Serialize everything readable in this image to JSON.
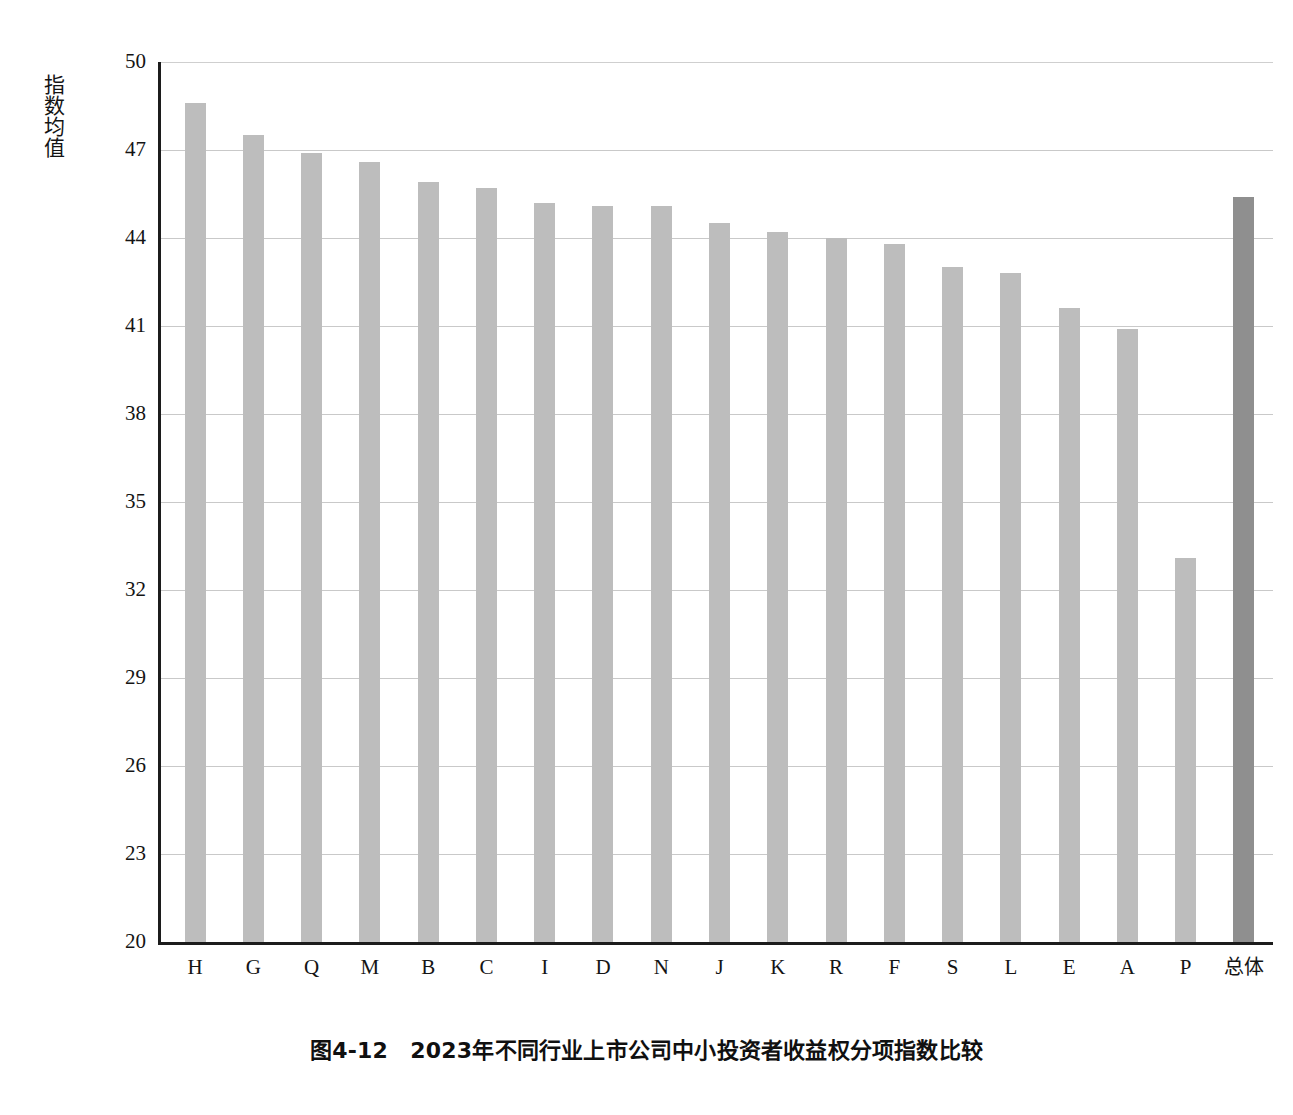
{
  "figure": {
    "caption": "图4-12　2023年不同行业上市公司中小投资者收益权分项指数比较",
    "y_axis_title": "指数均值"
  },
  "chart_data": {
    "type": "bar",
    "title": "图4-12　2023年不同行业上市公司中小投资者收益权分项指数比较",
    "xlabel": "",
    "ylabel": "指数均值",
    "ylim": [
      20,
      50
    ],
    "yticks": [
      20,
      23,
      26,
      29,
      32,
      35,
      38,
      41,
      44,
      47,
      50
    ],
    "ytick_labels": [
      "20",
      "23",
      "26",
      "29",
      "32",
      "35",
      "38",
      "41",
      "44",
      "47",
      "50"
    ],
    "grid": true,
    "legend": null,
    "categories": [
      "H",
      "G",
      "Q",
      "M",
      "B",
      "C",
      "I",
      "D",
      "N",
      "J",
      "K",
      "R",
      "F",
      "S",
      "L",
      "E",
      "A",
      "P",
      "总体"
    ],
    "values": [
      48.6,
      47.5,
      46.9,
      46.6,
      45.9,
      45.7,
      45.2,
      45.1,
      45.1,
      44.5,
      44.2,
      44.0,
      43.8,
      43.0,
      42.8,
      41.6,
      40.9,
      33.1,
      45.4
    ],
    "bar_colors": [
      "#bdbdbd",
      "#bdbdbd",
      "#bdbdbd",
      "#bdbdbd",
      "#bdbdbd",
      "#bdbdbd",
      "#bdbdbd",
      "#bdbdbd",
      "#bdbdbd",
      "#bdbdbd",
      "#bdbdbd",
      "#bdbdbd",
      "#bdbdbd",
      "#bdbdbd",
      "#bdbdbd",
      "#bdbdbd",
      "#bdbdbd",
      "#bdbdbd",
      "#8f8f8f"
    ],
    "highlight_category": "总体",
    "highlight_color": "#8f8f8f",
    "series_color": "#bdbdbd"
  }
}
